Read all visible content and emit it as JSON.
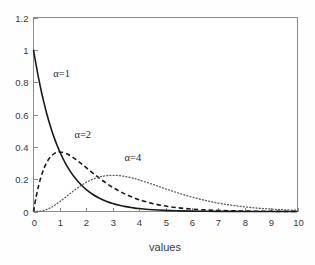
{
  "chart_data": {
    "type": "line",
    "title": "",
    "xlabel": "values",
    "ylabel": "",
    "xlim": [
      0,
      10
    ],
    "ylim": [
      0,
      1.2
    ],
    "grid": false,
    "legend_position": "inline-annotations",
    "xticks": [
      "0",
      "1",
      "2",
      "3",
      "4",
      "5",
      "6",
      "7",
      "8",
      "9",
      "10"
    ],
    "xtick_values": [
      0,
      1,
      2,
      3,
      4,
      5,
      6,
      7,
      8,
      9,
      10
    ],
    "yticks": [
      "0",
      "0.2",
      "0.4",
      "0.6",
      "0.8",
      "1",
      "1.2"
    ],
    "ytick_values": [
      0,
      0.2,
      0.4,
      0.6,
      0.8,
      1,
      1.2
    ],
    "x": [
      0,
      0.1,
      0.2,
      0.3,
      0.4,
      0.5,
      0.6,
      0.7,
      0.8,
      0.9,
      1,
      1.2,
      1.4,
      1.6,
      1.8,
      2,
      2.25,
      2.5,
      2.75,
      3,
      3.25,
      3.5,
      3.75,
      4,
      4.5,
      5,
      5.5,
      6,
      6.5,
      7,
      7.5,
      8,
      8.5,
      9,
      9.5,
      10
    ],
    "series": [
      {
        "name": "alpha=1",
        "label": "α=1",
        "linestyle": "solid",
        "color": "#1a1a1a",
        "label_x": 0.75,
        "label_y": 0.83,
        "values": [
          1,
          0.9048,
          0.8187,
          0.7408,
          0.6703,
          0.6065,
          0.5488,
          0.4966,
          0.4493,
          0.4066,
          0.3679,
          0.3012,
          0.2466,
          0.2019,
          0.1653,
          0.1353,
          0.1054,
          0.0821,
          0.0639,
          0.0498,
          0.0388,
          0.0302,
          0.0235,
          0.0183,
          0.0111,
          0.0067,
          0.0041,
          0.0025,
          0.0015,
          0.0009,
          0.0006,
          0.0003,
          0.0002,
          0.0001,
          0.0001,
          0.0
        ]
      },
      {
        "name": "alpha=2",
        "label": "α=2",
        "linestyle": "dashed",
        "color": "#1a1a1a",
        "label_x": 1.55,
        "label_y": 0.455,
        "values": [
          0,
          0.0905,
          0.1637,
          0.2222,
          0.2681,
          0.3033,
          0.3293,
          0.3476,
          0.3595,
          0.3659,
          0.3679,
          0.3614,
          0.3452,
          0.323,
          0.2975,
          0.2707,
          0.2372,
          0.2052,
          0.1758,
          0.1494,
          0.1261,
          0.1057,
          0.0882,
          0.0733,
          0.05,
          0.0337,
          0.0225,
          0.0149,
          0.0098,
          0.0064,
          0.0041,
          0.0027,
          0.0017,
          0.0011,
          0.0007,
          0.0005
        ]
      },
      {
        "name": "alpha=4",
        "label": "α=4",
        "linestyle": "dotted",
        "color": "#5e5e5e",
        "label_x": 3.45,
        "label_y": 0.31,
        "values": [
          0,
          0.0002,
          0.0011,
          0.0033,
          0.0072,
          0.0126,
          0.0198,
          0.0284,
          0.0383,
          0.0494,
          0.0613,
          0.0867,
          0.1128,
          0.1378,
          0.1607,
          0.1804,
          0.2001,
          0.2138,
          0.2216,
          0.224,
          0.2219,
          0.2158,
          0.2068,
          0.1954,
          0.1687,
          0.1404,
          0.1137,
          0.0892,
          0.0688,
          0.0521,
          0.0389,
          0.0286,
          0.0208,
          0.015,
          0.0107,
          0.0076
        ]
      }
    ]
  },
  "axes": {
    "x_label": "values"
  }
}
